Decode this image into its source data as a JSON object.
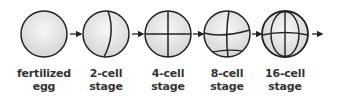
{
  "colors": {
    "stroke": "#222222",
    "fill_center": "#f6f6f6",
    "fill_edge": "#d8d8d8",
    "text": "#333333"
  },
  "stages": [
    {
      "id": "fertilized-egg",
      "line1": "fertilized",
      "line2": "egg",
      "cells": 1,
      "cx": 44
    },
    {
      "id": "2-cell",
      "line1": "2-cell",
      "line2": "stage",
      "cells": 2,
      "cx": 106
    },
    {
      "id": "4-cell",
      "line1": "4-cell",
      "line2": "stage",
      "cells": 4,
      "cx": 168
    },
    {
      "id": "8-cell",
      "line1": "8-cell",
      "line2": "stage",
      "cells": 8,
      "cx": 227
    },
    {
      "id": "16-cell",
      "line1": "16-cell",
      "line2": "stage",
      "cells": 16,
      "cx": 285
    }
  ],
  "arrows": [
    {
      "from": "fertilized-egg",
      "to": "2-cell"
    },
    {
      "from": "2-cell",
      "to": "4-cell"
    },
    {
      "from": "4-cell",
      "to": "8-cell"
    },
    {
      "from": "8-cell",
      "to": "16-cell"
    },
    {
      "from": "16-cell",
      "to": "next"
    }
  ]
}
